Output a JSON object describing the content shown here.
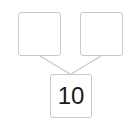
{
  "diagram": {
    "type": "number-bond",
    "parts": [
      {
        "id": "left-part",
        "value": ""
      },
      {
        "id": "right-part",
        "value": ""
      }
    ],
    "whole": {
      "id": "whole",
      "value": "10"
    },
    "colors": {
      "border": "#c9c9c9",
      "text": "#1a1a1a",
      "background": "#ffffff"
    }
  }
}
